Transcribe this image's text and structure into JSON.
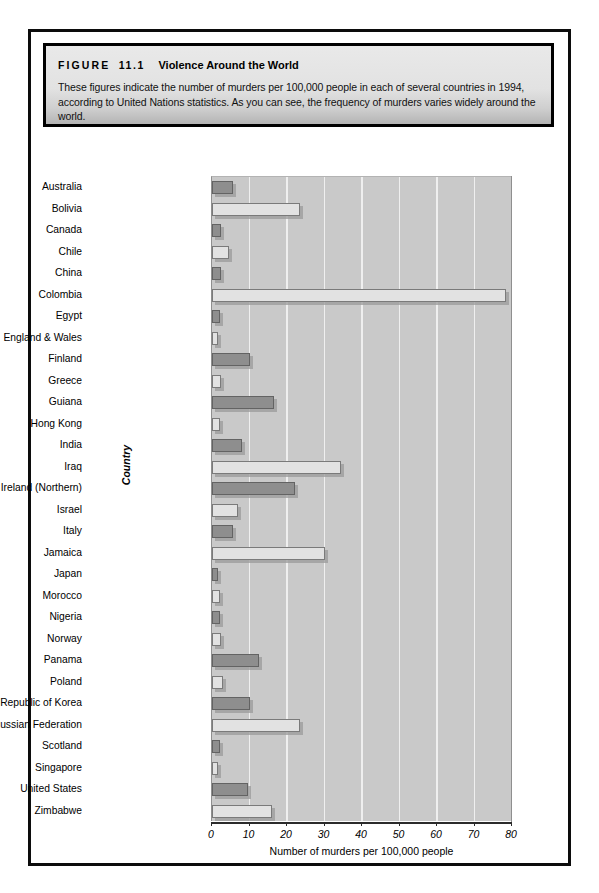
{
  "figure": {
    "label": "FIGURE",
    "number": "11.1",
    "title": "Violence Around the World",
    "caption": "These figures indicate the number of murders per 100,000 people in each of several countries in 1994, according to United Nations statistics. As you can see, the frequency of murders varies widely around the world."
  },
  "chart_data": {
    "type": "bar",
    "orientation": "horizontal",
    "title": "Violence Around the World",
    "xlabel": "Number of murders per 100,000 people",
    "ylabel": "Country",
    "xlim": [
      0,
      80
    ],
    "xticks": [
      0,
      10,
      20,
      30,
      40,
      50,
      60,
      70,
      80
    ],
    "grid": true,
    "legend": null,
    "categories": [
      "Australia",
      "Bolivia",
      "Canada",
      "Chile",
      "China",
      "Colombia",
      "Egypt",
      "England & Wales",
      "Finland",
      "Greece",
      "Guiana",
      "Hong Kong",
      "India",
      "Iraq",
      "Ireland (Northern)",
      "Israel",
      "Italy",
      "Jamaica",
      "Japan",
      "Morocco",
      "Nigeria",
      "Norway",
      "Panama",
      "Poland",
      "Republic of Korea",
      "Russian Federation",
      "Scotland",
      "Singapore",
      "United States",
      "Zimbabwe"
    ],
    "values": [
      5.5,
      23.5,
      2.5,
      4.5,
      2.5,
      78.5,
      2.0,
      1.5,
      10.0,
      2.5,
      16.5,
      2.0,
      8.0,
      34.5,
      22.0,
      7.0,
      5.5,
      30.0,
      1.5,
      2.0,
      2.0,
      2.5,
      12.5,
      3.0,
      10.0,
      23.5,
      2.0,
      1.5,
      9.5,
      16.0
    ]
  },
  "colors": {
    "bar_dark": "#8e8e8e",
    "bar_light": "#e2e2e2",
    "plot_background": "#c9c9c9",
    "gridline": "#efefef",
    "axis": "#2b2b2b",
    "frame_border": "#0c0c0c"
  }
}
